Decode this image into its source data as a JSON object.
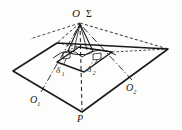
{
  "figure": {
    "title": "",
    "background_color": "#fdfdfc",
    "stroke_color": "#1a1a1a"
  },
  "labels": {
    "apex": "O",
    "sigma": "Σ",
    "delta1_base": "δ",
    "delta1_sub": "1",
    "delta1_prime": "′",
    "delta2_base": "δ",
    "delta2_sub": "2",
    "delta2_prime": "′",
    "o1_base": "O",
    "o1_sub": "1",
    "o2_base": "O",
    "o2_sub": "2",
    "point_p": "P"
  },
  "geometry": {
    "outer_quad": "13,71 57,43 168,49 82,112",
    "inner_quad": "57,62 79,47 112,52 84,72",
    "apex_point": "80,22",
    "p_point": "82,112",
    "cone_base_cx": 81,
    "cone_base_cy": 50,
    "cone_base_rx": 19,
    "cone_base_ry": 6
  }
}
